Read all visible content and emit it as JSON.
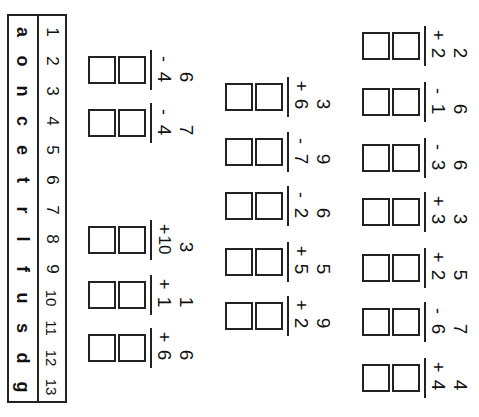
{
  "key": {
    "numbers": [
      "1",
      "2",
      "3",
      "4",
      "5",
      "6",
      "7",
      "8",
      "9",
      "10",
      "11",
      "12",
      "13"
    ],
    "letters": [
      "a",
      "o",
      "n",
      "c",
      "e",
      "t",
      "r",
      "l",
      "f",
      "u",
      "s",
      "d",
      "g"
    ]
  },
  "columns": [
    {
      "x": 362,
      "problems": [
        {
          "y": 26,
          "a": "2",
          "op": "+",
          "b": "2"
        },
        {
          "y": 82,
          "a": "6",
          "op": "-",
          "b": "1"
        },
        {
          "y": 138,
          "a": "6",
          "op": "-",
          "b": "3"
        },
        {
          "y": 192,
          "a": "3",
          "op": "+",
          "b": "3"
        },
        {
          "y": 248,
          "a": "5",
          "op": "+",
          "b": "2"
        },
        {
          "y": 302,
          "a": "7",
          "op": "-",
          "b": "6"
        },
        {
          "y": 358,
          "a": "4",
          "op": "+",
          "b": "4"
        }
      ]
    },
    {
      "x": 225,
      "problems": [
        {
          "y": 77,
          "a": "3",
          "op": "+",
          "b": "6"
        },
        {
          "y": 132,
          "a": "9",
          "op": "-",
          "b": "7"
        },
        {
          "y": 186,
          "a": "6",
          "op": "-",
          "b": "2"
        },
        {
          "y": 242,
          "a": "5",
          "op": "+",
          "b": "5"
        },
        {
          "y": 296,
          "a": "9",
          "op": "+",
          "b": "2"
        }
      ]
    },
    {
      "x": 88,
      "problems": [
        {
          "y": 50,
          "a": "6",
          "op": "-",
          "b": "4"
        },
        {
          "y": 103,
          "a": "7",
          "op": "-",
          "b": "4"
        },
        {
          "y": 220,
          "a": "3",
          "op": "+",
          "b": "10"
        },
        {
          "y": 275,
          "a": "1",
          "op": "+",
          "b": "1"
        },
        {
          "y": 328,
          "a": "6",
          "op": "+",
          "b": "6"
        }
      ]
    }
  ]
}
